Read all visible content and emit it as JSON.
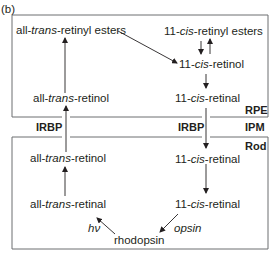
{
  "panel_label": "(b)",
  "compartments": {
    "rpe": "RPE",
    "ipm": "IPM",
    "rod": "Rod"
  },
  "transporters": {
    "left": "IRBP",
    "right": "IRBP"
  },
  "nodes": {
    "rpe_all_trans_esters": {
      "pre": "all-",
      "it": "trans",
      "post": "-retinyl esters"
    },
    "rpe_11cis_esters": {
      "pre": "11-",
      "it": "cis",
      "post": "-retinyl esters"
    },
    "rpe_11cis_retinol": {
      "pre": "11-",
      "it": "cis",
      "post": "-retinol"
    },
    "rpe_all_trans_retinol": {
      "pre": "all-",
      "it": "trans",
      "post": "-retinol"
    },
    "rpe_11cis_retinal": {
      "pre": "11-",
      "it": "cis",
      "post": "-retinal"
    },
    "rod_all_trans_retinol": {
      "pre": "all-",
      "it": "trans",
      "post": "-retinol"
    },
    "rod_11cis_retinal_top": {
      "pre": "11-",
      "it": "cis",
      "post": "-retinal"
    },
    "rod_all_trans_retinal": {
      "pre": "all-",
      "it": "trans",
      "post": "-retinal"
    },
    "rod_11cis_retinal_bottom": {
      "pre": "11-",
      "it": "cis",
      "post": "-retinal"
    },
    "rhodopsin": "rhodopsin"
  },
  "edge_labels": {
    "light": "hν",
    "opsin": "opsin"
  },
  "colors": {
    "line": "#6d6e71",
    "text": "#231f20",
    "arrow": "#231f20"
  }
}
